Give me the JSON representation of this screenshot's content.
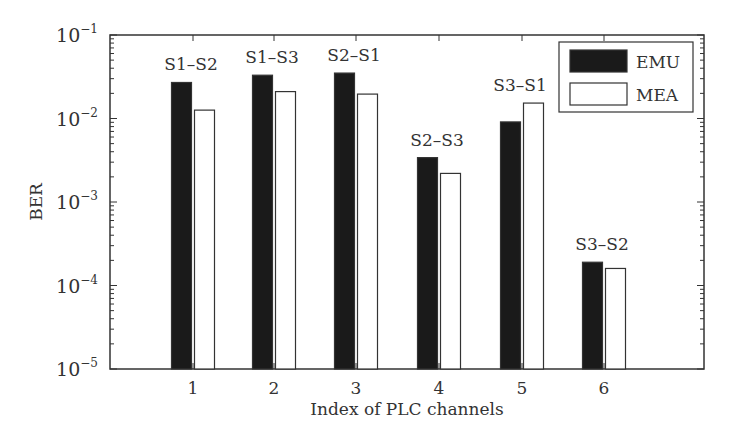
{
  "chart_data": {
    "type": "bar",
    "title": "",
    "xlabel": "Index of PLC channels",
    "ylabel": "BER",
    "yscale": "log",
    "ylim": [
      1e-05,
      0.1
    ],
    "yticks": [
      "10^-5",
      "10^-4",
      "10^-3",
      "10^-2",
      "10^-1"
    ],
    "categories": [
      "1",
      "2",
      "3",
      "4",
      "5",
      "6"
    ],
    "annotations": [
      "S1–S2",
      "S1–S3",
      "S2–S1",
      "S2–S3",
      "S3–S1",
      "S3–S2"
    ],
    "series": [
      {
        "name": "EMU",
        "color": "#1a1a1a",
        "values": [
          0.027,
          0.033,
          0.035,
          0.0034,
          0.0091,
          0.00019
        ]
      },
      {
        "name": "MEA",
        "color": "#ffffff",
        "values": [
          0.0126,
          0.021,
          0.0196,
          0.0022,
          0.0153,
          0.00016
        ]
      }
    ],
    "legend_position": "upper right",
    "grid": false
  }
}
